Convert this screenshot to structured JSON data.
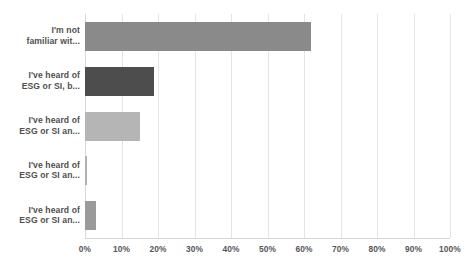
{
  "chart_data": {
    "type": "bar",
    "orientation": "horizontal",
    "title": "",
    "subtitle": "",
    "xlabel": "",
    "ylabel": "",
    "xlim": [
      0,
      100
    ],
    "grid": true,
    "legend": false,
    "categories": [
      "I'm not\nfamiliar wit...",
      "I've heard of\nESG or SI, b...",
      "I've heard of\nESG or SI an...",
      "I've heard of\nESG or SI an...",
      "I've heard of\nESG or SI an..."
    ],
    "values": [
      62,
      19,
      15,
      0.5,
      3
    ],
    "value_unit": "%",
    "bar_colors": [
      "#8a8a8a",
      "#4d4d4d",
      "#b5b5b5",
      "#b0b0b0",
      "#9a9a9a"
    ],
    "xticks": [
      0,
      10,
      20,
      30,
      40,
      50,
      60,
      70,
      80,
      90,
      100
    ],
    "xticklabels": [
      "0%",
      "10%",
      "20%",
      "30%",
      "40%",
      "50%",
      "60%",
      "70%",
      "80%",
      "90%",
      "100%"
    ]
  },
  "style": {
    "background": "#ffffff",
    "gridline_color": "#e4e4e4",
    "axis_color": "#d4d4d4",
    "label_color": "#4f4f4f",
    "tick_color": "#55565a"
  }
}
